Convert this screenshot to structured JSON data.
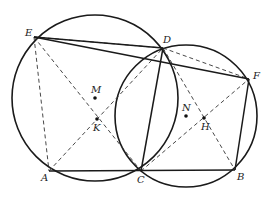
{
  "figure": {
    "type": "geometry",
    "points": {
      "A": {
        "label": "A",
        "x": 49,
        "y": 171
      },
      "B": {
        "label": "B",
        "x": 235,
        "y": 170
      },
      "C": {
        "label": "C",
        "x": 141,
        "y": 171
      },
      "D": {
        "label": "D",
        "x": 163,
        "y": 48
      },
      "E": {
        "label": "E",
        "x": 34,
        "y": 37
      },
      "F": {
        "label": "F",
        "x": 249,
        "y": 79
      },
      "M": {
        "label": "M",
        "x": 95,
        "y": 98
      },
      "N": {
        "label": "N",
        "x": 186,
        "y": 116
      },
      "K": {
        "label": "K",
        "x": 97,
        "y": 119
      },
      "H": {
        "label": "H",
        "x": 204,
        "y": 118
      }
    },
    "circles": [
      {
        "name": "circle-M",
        "center": "M",
        "cx": 95,
        "cy": 98,
        "r": 83
      },
      {
        "name": "circle-N",
        "center": "N",
        "cx": 186,
        "cy": 116,
        "r": 71
      }
    ],
    "solid_segments": [
      [
        "E",
        "D"
      ],
      [
        "E",
        "F"
      ],
      [
        "A",
        "B"
      ],
      [
        "C",
        "D"
      ],
      [
        "F",
        "B"
      ]
    ],
    "dashed_segments": [
      [
        "E",
        "A"
      ],
      [
        "E",
        "C"
      ],
      [
        "A",
        "D"
      ],
      [
        "E",
        "D"
      ],
      [
        "D",
        "F"
      ],
      [
        "D",
        "B"
      ],
      [
        "C",
        "F"
      ]
    ]
  }
}
